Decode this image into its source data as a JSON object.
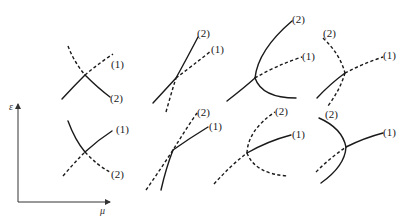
{
  "diagram": {
    "axes": {
      "y_label": "ε",
      "x_label": "μ"
    },
    "curve_labels": {
      "one": "(1)",
      "two": "(2)"
    },
    "line_color": "#1a1a1a",
    "panels": [
      {
        "row": 1,
        "col": 1,
        "label_1": "(1)",
        "label_2": "(2)"
      },
      {
        "row": 1,
        "col": 2,
        "label_1": "(1)",
        "label_2": "(2)"
      },
      {
        "row": 1,
        "col": 3,
        "label_1": "(1)",
        "label_2": "(2)"
      },
      {
        "row": 1,
        "col": 4,
        "label_1": "(1)",
        "label_2": "(2)"
      },
      {
        "row": 2,
        "col": 1,
        "label_1": "(1)",
        "label_2": "(2)"
      },
      {
        "row": 2,
        "col": 2,
        "label_1": "(1)",
        "label_2": "(2)"
      },
      {
        "row": 2,
        "col": 3,
        "label_1": "(1)",
        "label_2": "(2)"
      },
      {
        "row": 2,
        "col": 4,
        "label_1": "(1)",
        "label_2": "(2)"
      }
    ]
  }
}
